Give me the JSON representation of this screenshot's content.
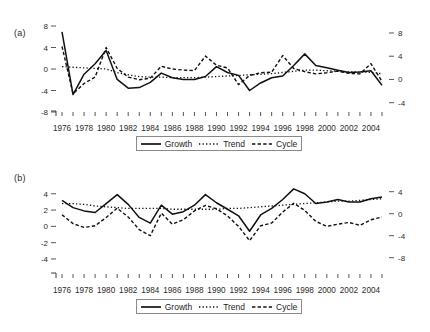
{
  "figure": {
    "background": "#ffffff",
    "ink": "#1a1a1a"
  },
  "panels": [
    {
      "id": "a",
      "label": "(a)"
    },
    {
      "id": "b",
      "label": "(b)"
    }
  ],
  "legend": {
    "items": [
      {
        "label": "Growth",
        "style": "solid",
        "icon": "solid-line-swatch"
      },
      {
        "label": "Trend",
        "style": "dotted",
        "icon": "dotted-line-swatch"
      },
      {
        "label": "Cycle",
        "style": "dashed",
        "icon": "dashed-line-swatch"
      }
    ]
  },
  "chart_data": [
    {
      "type": "line",
      "panel": "(a)",
      "title": "",
      "xlabel": "",
      "ylabel": "",
      "grid": false,
      "legend_position": "bottom-center",
      "x": [
        1976,
        1977,
        1978,
        1979,
        1980,
        1981,
        1982,
        1983,
        1984,
        1985,
        1986,
        1987,
        1988,
        1989,
        1990,
        1991,
        1992,
        1993,
        1994,
        1995,
        1996,
        1997,
        1998,
        1999,
        2000,
        2001,
        2002,
        2003,
        2004,
        2005
      ],
      "xtick_labels": [
        "1976",
        "1978",
        "1980",
        "1982",
        "1984",
        "1986",
        "1988",
        "1990",
        "1992",
        "1994",
        "1996",
        "1998",
        "2000",
        "2002",
        "2004"
      ],
      "xlim": [
        1976,
        2005
      ],
      "left_axis": {
        "ticks": [
          8,
          4,
          0,
          -4,
          -8
        ],
        "tick_labels": [
          "8",
          "4",
          "0",
          "-4",
          "-8"
        ],
        "ylim": [
          -8,
          8
        ],
        "applies_to": [
          "Cycle"
        ]
      },
      "right_axis": {
        "ticks": [
          8,
          4,
          0,
          -4
        ],
        "tick_labels": [
          "8",
          "4",
          "0",
          "-4"
        ],
        "ylim": [
          -5.6,
          9.2
        ],
        "applies_to": [
          "Growth",
          "Trend"
        ]
      },
      "series": [
        {
          "name": "Growth",
          "style": "solid",
          "axis": "right",
          "values": [
            8.2,
            -2.6,
            0.9,
            2.7,
            5.0,
            0.0,
            -1.5,
            -1.4,
            -0.5,
            1.1,
            0.3,
            0.0,
            0.0,
            0.5,
            2.2,
            1.2,
            0.7,
            -1.9,
            -0.6,
            0.3,
            0.6,
            2.4,
            4.4,
            2.4,
            2.0,
            1.6,
            1.2,
            1.3,
            1.5,
            -1.0
          ]
        },
        {
          "name": "Trend",
          "style": "dotted",
          "axis": "right",
          "values": [
            2.2,
            2.1,
            2.0,
            1.9,
            1.8,
            1.2,
            0.8,
            0.5,
            0.4,
            0.4,
            0.3,
            0.3,
            0.3,
            0.4,
            0.5,
            0.6,
            0.7,
            0.8,
            0.9,
            1.0,
            1.2,
            1.4,
            1.6,
            1.6,
            1.5,
            1.4,
            1.3,
            1.3,
            1.2,
            1.0
          ]
        },
        {
          "name": "Cycle",
          "style": "dashed",
          "axis": "left",
          "values": [
            4.2,
            -4.6,
            -2.7,
            -1.5,
            4.0,
            0.1,
            -1.5,
            -2.0,
            -1.7,
            0.5,
            0.0,
            -0.2,
            -0.3,
            2.4,
            0.7,
            0.2,
            -2.9,
            -1.2,
            -0.7,
            -0.6,
            2.5,
            0.1,
            -0.5,
            -0.9,
            -0.7,
            -0.4,
            -0.8,
            -0.9,
            1.0,
            -2.3
          ]
        }
      ]
    },
    {
      "type": "line",
      "panel": "(b)",
      "title": "",
      "xlabel": "",
      "ylabel": "",
      "grid": false,
      "legend_position": "bottom-center",
      "x": [
        1976,
        1977,
        1978,
        1979,
        1980,
        1981,
        1982,
        1983,
        1984,
        1985,
        1986,
        1987,
        1988,
        1989,
        1990,
        1991,
        1992,
        1993,
        1994,
        1995,
        1996,
        1997,
        1998,
        1999,
        2000,
        2001,
        2002,
        2003,
        2004,
        2005
      ],
      "xtick_labels": [
        "1976",
        "1978",
        "1980",
        "1982",
        "1984",
        "1986",
        "1988",
        "1990",
        "1992",
        "1994",
        "1996",
        "1998",
        "2000",
        "2002",
        "2004"
      ],
      "xlim": [
        1976,
        2005
      ],
      "left_axis": {
        "ticks": [
          4,
          2,
          0,
          -2,
          -4
        ],
        "tick_labels": [
          "4",
          "2",
          "0",
          "-2",
          "-4"
        ],
        "ylim": [
          -5.6,
          5.2
        ],
        "applies_to": [
          "Growth",
          "Trend"
        ]
      },
      "right_axis": {
        "ticks": [
          4,
          0,
          -4,
          -8
        ],
        "tick_labels": [
          "4",
          "0",
          "-4",
          "-8"
        ],
        "ylim": [
          -10.6,
          5.4
        ],
        "applies_to": [
          "Cycle"
        ]
      },
      "series": [
        {
          "name": "Growth",
          "style": "solid",
          "axis": "left",
          "values": [
            3.2,
            2.3,
            1.9,
            1.7,
            2.8,
            3.9,
            2.7,
            1.1,
            0.4,
            2.6,
            1.5,
            1.8,
            2.6,
            3.9,
            2.9,
            2.1,
            1.3,
            -0.6,
            1.4,
            2.2,
            3.3,
            4.6,
            4.0,
            2.8,
            3.0,
            3.3,
            3.0,
            3.0,
            3.4,
            3.6
          ]
        },
        {
          "name": "Trend",
          "style": "dotted",
          "axis": "left",
          "values": [
            2.8,
            2.8,
            2.7,
            2.5,
            2.4,
            2.3,
            2.2,
            2.2,
            2.2,
            2.2,
            2.1,
            2.1,
            2.1,
            2.1,
            2.1,
            2.2,
            2.2,
            2.3,
            2.4,
            2.5,
            2.6,
            2.7,
            2.8,
            2.9,
            3.0,
            3.1,
            3.1,
            3.2,
            3.3,
            3.4
          ]
        },
        {
          "name": "Cycle",
          "style": "dashed",
          "axis": "right",
          "values": [
            -0.2,
            -1.8,
            -2.5,
            -2.2,
            -0.7,
            1.0,
            -0.6,
            -2.9,
            -4.0,
            0.1,
            -1.9,
            -1.1,
            0.5,
            1.5,
            0.9,
            -0.4,
            -2.3,
            -4.9,
            -2.2,
            -1.7,
            0.3,
            1.9,
            0.6,
            -1.4,
            -2.3,
            -1.9,
            -1.6,
            -2.1,
            -1.1,
            -0.6
          ]
        }
      ]
    }
  ]
}
